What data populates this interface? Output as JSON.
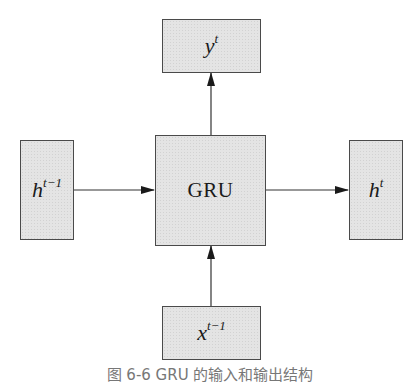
{
  "diagram": {
    "nodes": {
      "input_hidden": {
        "base": "h",
        "superscript": "t−1"
      },
      "output_y": {
        "base": "y",
        "superscript": "t"
      },
      "gru": {
        "label": "GRU"
      },
      "output_hidden": {
        "base": "h",
        "superscript": "t"
      },
      "input_x": {
        "base": "x",
        "superscript": "t−1"
      }
    },
    "edges": [
      {
        "from": "input_hidden",
        "to": "gru"
      },
      {
        "from": "gru",
        "to": "output_hidden"
      },
      {
        "from": "gru",
        "to": "output_y"
      },
      {
        "from": "input_x",
        "to": "gru"
      }
    ],
    "caption": "图 6-6  GRU 的输入和输出结构",
    "colors": {
      "box_fill": "#e4e4e4",
      "border": "#4a4a4a",
      "arrow": "#1a1a1a"
    }
  }
}
